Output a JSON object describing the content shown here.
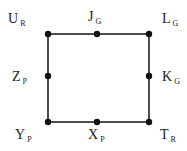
{
  "diagram": {
    "type": "square-graph",
    "line_color": "#222222",
    "node_color": "#111111",
    "nodes": [
      {
        "id": "U",
        "label": "U",
        "sub": "R",
        "pos": "top-left"
      },
      {
        "id": "J",
        "label": "J",
        "sub": "G",
        "pos": "top-middle"
      },
      {
        "id": "L",
        "label": "L",
        "sub": "G",
        "pos": "top-right"
      },
      {
        "id": "Z",
        "label": "Z",
        "sub": "P",
        "pos": "middle-left"
      },
      {
        "id": "K",
        "label": "K",
        "sub": "G",
        "pos": "middle-right"
      },
      {
        "id": "Y",
        "label": "Y",
        "sub": "P",
        "pos": "bottom-left"
      },
      {
        "id": "X",
        "label": "X",
        "sub": "P",
        "pos": "bottom-middle"
      },
      {
        "id": "T",
        "label": "T",
        "sub": "R",
        "pos": "bottom-right"
      }
    ],
    "edges": [
      [
        "U",
        "J"
      ],
      [
        "J",
        "L"
      ],
      [
        "L",
        "K"
      ],
      [
        "K",
        "T"
      ],
      [
        "T",
        "X"
      ],
      [
        "X",
        "Y"
      ],
      [
        "Y",
        "Z"
      ],
      [
        "Z",
        "U"
      ]
    ]
  }
}
